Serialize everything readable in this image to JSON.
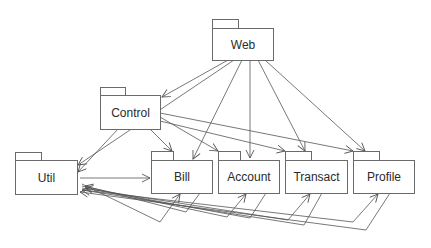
{
  "diagram": {
    "type": "uml-package-diagram",
    "colors": {
      "line": "#555555",
      "border": "#6a6a6a",
      "text": "#2a2a2a",
      "background": "#ffffff"
    },
    "packages": [
      {
        "id": "web",
        "label": "Web"
      },
      {
        "id": "control",
        "label": "Control"
      },
      {
        "id": "util",
        "label": "Util"
      },
      {
        "id": "bill",
        "label": "Bill"
      },
      {
        "id": "account",
        "label": "Account"
      },
      {
        "id": "transact",
        "label": "Transact"
      },
      {
        "id": "profile",
        "label": "Profile"
      }
    ],
    "dependencies": [
      {
        "from": "Web",
        "to": "Control"
      },
      {
        "from": "Web",
        "to": "Util"
      },
      {
        "from": "Web",
        "to": "Bill"
      },
      {
        "from": "Web",
        "to": "Account"
      },
      {
        "from": "Web",
        "to": "Transact"
      },
      {
        "from": "Web",
        "to": "Profile"
      },
      {
        "from": "Control",
        "to": "Util"
      },
      {
        "from": "Control",
        "to": "Bill"
      },
      {
        "from": "Control",
        "to": "Account"
      },
      {
        "from": "Control",
        "to": "Transact"
      },
      {
        "from": "Control",
        "to": "Profile"
      },
      {
        "from": "Util",
        "to": "Bill"
      },
      {
        "from": "Bill",
        "to": "Util"
      },
      {
        "from": "Account",
        "to": "Util"
      },
      {
        "from": "Transact",
        "to": "Util"
      },
      {
        "from": "Profile",
        "to": "Util"
      },
      {
        "from": "Util",
        "to": "Account"
      },
      {
        "from": "Util",
        "to": "Transact"
      },
      {
        "from": "Util",
        "to": "Profile"
      }
    ]
  }
}
